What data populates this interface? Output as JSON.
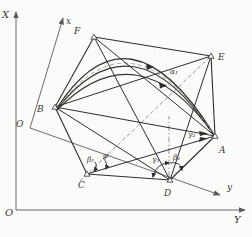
{
  "figure": {
    "background": "#fbfbf9",
    "line_color": "#2e2e2c",
    "axis_color": "#5a5a56",
    "dash_color": "#8a8a86",
    "fixed_frame": {
      "x_axis_label": "X",
      "y_axis_label": "Y",
      "origin_label": "O"
    },
    "moving_frame": {
      "x_axis_label": "x",
      "y_axis_label": "y",
      "origin_label": "O"
    },
    "points": {
      "A": "A",
      "B": "B",
      "C": "C",
      "D": "D",
      "E": "E",
      "F": "F"
    },
    "angles": {
      "alpha1": "α₁",
      "beta1": "β₁",
      "beta2": "β₂",
      "gamma1": "γ₁",
      "gamma2": "γ₂",
      "phi": "φ"
    }
  }
}
